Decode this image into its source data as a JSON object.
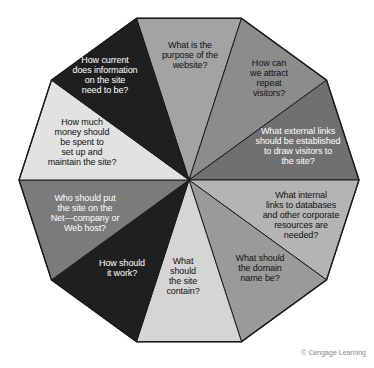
{
  "figure": {
    "type": "decagon-wheel-diagram",
    "center": {
      "x": 189,
      "y": 180
    },
    "radius": 170,
    "sides": 10,
    "outline_color": "#1a1a1a",
    "background": "#ffffff",
    "segments": [
      {
        "id": "purpose",
        "text": "What is the\npurpose of the\nwebsite?",
        "fill": "#a3a3a3",
        "text_color": "#111111"
      },
      {
        "id": "attract",
        "text": "How can\nwe attract\nrepeat\nvisitors?",
        "fill": "#8c8c8c",
        "text_color": "#111111"
      },
      {
        "id": "external-links",
        "text": "What external links\nshould be established\nto draw visitors to\nthe site?",
        "fill": "#707070",
        "text_color": "#ffffff"
      },
      {
        "id": "internal-links",
        "text": "What internal\nlinks to databases\nand other corporate\nresources are\nneeded?",
        "fill": "#b4b4b4",
        "text_color": "#111111"
      },
      {
        "id": "domain-name",
        "text": "What should\nthe domain\nname be?",
        "fill": "#9a9a9a",
        "text_color": "#111111"
      },
      {
        "id": "site-contain",
        "text": "What\nshould\nthe site\ncontain?",
        "fill": "#d5d5d5",
        "text_color": "#111111"
      },
      {
        "id": "how-work",
        "text": "How should\nit work?",
        "fill": "#1f1f1f",
        "text_color": "#ffffff"
      },
      {
        "id": "host",
        "text": "Who should put\nthe site on the\nNet—company or\nWeb host?",
        "fill": "#7b7b7b",
        "text_color": "#ffffff"
      },
      {
        "id": "money",
        "text": "How much\nmoney should\nbe spent to\nset up and\nmaintain the site?",
        "fill": "#e2e2e2",
        "text_color": "#111111"
      },
      {
        "id": "currency",
        "text": "How current\ndoes information\non the site\nneed to be?",
        "fill": "#1f1f1f",
        "text_color": "#ffffff"
      }
    ]
  },
  "credit": {
    "text": "© Cengage Learning",
    "color": "#8a8a8a"
  },
  "top_clipped_caption": {
    "left_fragment": "",
    "right_fragment": ""
  },
  "chart_data": {
    "type": "pie",
    "xlabel": "",
    "ylabel": "",
    "legend_position": "none",
    "grid": false,
    "categories": [
      "What is the purpose of the website?",
      "How can we attract repeat visitors?",
      "What external links should be established to draw visitors to the site?",
      "What internal links to databases and other corporate resources are needed?",
      "What should the domain name be?",
      "What should the site contain?",
      "How should it work?",
      "Who should put the site on the Net—company or Web host?",
      "How much money should be spent to set up and maintain the site?",
      "How current does information on the site need to be?"
    ],
    "values": [
      10,
      10,
      10,
      10,
      10,
      10,
      10,
      10,
      10,
      10
    ],
    "colors": [
      "#a3a3a3",
      "#8c8c8c",
      "#707070",
      "#b4b4b4",
      "#9a9a9a",
      "#d5d5d5",
      "#1f1f1f",
      "#7b7b7b",
      "#e2e2e2",
      "#1f1f1f"
    ],
    "annotations": [
      "© Cengage Learning"
    ]
  }
}
